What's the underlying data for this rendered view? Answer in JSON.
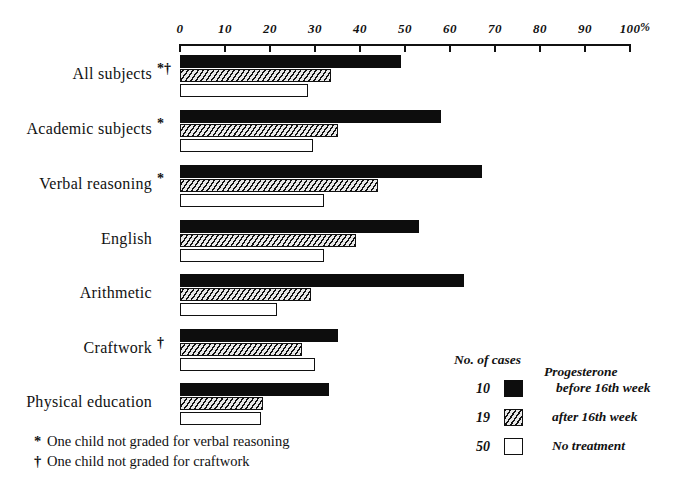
{
  "chart_data": {
    "type": "bar",
    "orientation": "horizontal",
    "title": "",
    "xlabel": "%",
    "ylabel": "",
    "xlim": [
      0,
      100
    ],
    "grid": false,
    "legend_position": "bottom-right",
    "axis_ticks": [
      0,
      10,
      20,
      30,
      40,
      50,
      60,
      70,
      80,
      90,
      100
    ],
    "axis_tick_labels": [
      "0",
      "10",
      "20",
      "30",
      "40",
      "50",
      "60",
      "70",
      "80",
      "90",
      "100"
    ],
    "axis_unit": "%",
    "categories": [
      "All subjects",
      "Academic subjects",
      "Verbal reasoning",
      "English",
      "Arithmetic",
      "Craftwork",
      "Physical education"
    ],
    "category_markers": [
      "*†",
      "*",
      "*",
      "",
      "",
      "†",
      ""
    ],
    "series": [
      {
        "name": "Progesterone before 16th week",
        "n": 10,
        "fill": "black",
        "values": [
          49,
          58,
          67,
          53,
          63,
          35,
          33
        ]
      },
      {
        "name": "Progesterone after 16th week",
        "n": 19,
        "fill": "hatched",
        "values": [
          33.5,
          35,
          44,
          39,
          29,
          27,
          18.5
        ]
      },
      {
        "name": "No treatment",
        "n": 50,
        "fill": "white",
        "values": [
          28.5,
          29.5,
          32,
          32,
          21.5,
          30,
          18
        ]
      }
    ]
  },
  "legend": {
    "count_header": "No. of cases",
    "treatment_header": "Progesterone",
    "rows": [
      {
        "count": "10",
        "swatch": "black",
        "label": "before 16th week",
        "indent": true
      },
      {
        "count": "19",
        "swatch": "hatch",
        "label": "after 16th week",
        "indent": false
      },
      {
        "count": "50",
        "swatch": "white",
        "label": "No treatment",
        "indent": false
      }
    ]
  },
  "footnotes": [
    {
      "symbol": "*",
      "text": "One child not graded for verbal reasoning"
    },
    {
      "symbol": "†",
      "text": "One child not graded for craftwork"
    }
  ],
  "colors": {
    "ink": "#111111",
    "black_fill": "#0d0d0d",
    "hatch_fill": "#d8d8d8",
    "white_fill": "#ffffff",
    "background": "#ffffff"
  }
}
